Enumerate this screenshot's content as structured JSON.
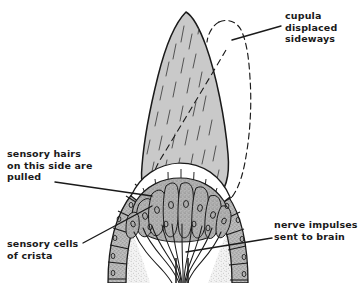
{
  "diagram": {
    "background_color": "#ffffff",
    "ink_color": "#1a1a1a",
    "cupula_fill": "#c9c9c9",
    "cell_fill": "#b0b0b0",
    "supporting_cell_fill": "#ffffff",
    "stipple_fill": "#ededed"
  },
  "labels": {
    "cupula": "cupula displaced\nsideways",
    "hairs": "sensory hairs\non this side are\npulled",
    "cells": "sensory cells\nof crista",
    "nerve": "nerve impulses\nsent to brain"
  },
  "parts": {
    "cupula": "cupula",
    "displaced_outline": "displaced-cupula-outline",
    "hair_cells": "sensory-hair-cells",
    "supporting_cells": "supporting-cells",
    "crista_epithelium": "crista-epithelium",
    "nerve_fibres": "nerve-fibres"
  }
}
